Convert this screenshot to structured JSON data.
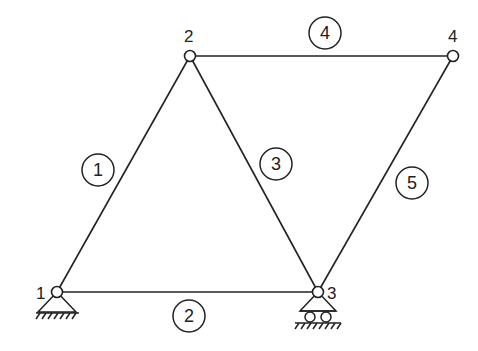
{
  "diagram": {
    "type": "truss",
    "colors": {
      "line": "#222222",
      "background": "#ffffff"
    },
    "nodes": [
      {
        "id": "1",
        "label": "1",
        "x": 57,
        "y": 292,
        "support": "pin"
      },
      {
        "id": "2",
        "label": "2",
        "x": 190,
        "y": 56,
        "support": "none"
      },
      {
        "id": "3",
        "label": "3",
        "x": 318,
        "y": 292,
        "support": "roller"
      },
      {
        "id": "4",
        "label": "4",
        "x": 453,
        "y": 56,
        "support": "none"
      }
    ],
    "members": [
      {
        "id": "1",
        "label": "1",
        "from": "1",
        "to": "2"
      },
      {
        "id": "2",
        "label": "2",
        "from": "1",
        "to": "3"
      },
      {
        "id": "3",
        "label": "3",
        "from": "2",
        "to": "3"
      },
      {
        "id": "4",
        "label": "4",
        "from": "2",
        "to": "4"
      },
      {
        "id": "5",
        "label": "5",
        "from": "3",
        "to": "4"
      }
    ]
  }
}
